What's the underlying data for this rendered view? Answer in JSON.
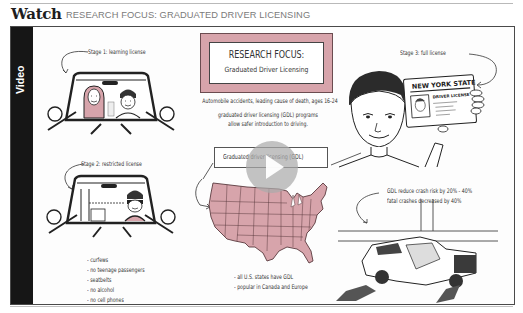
{
  "header": {
    "section_label": "Watch",
    "title": "RESEARCH FOCUS: GRADUATED DRIVER LICENSING"
  },
  "video": {
    "sidebar_label": "Video",
    "play_button": {
      "icon": "play-icon",
      "state": "paused"
    },
    "title_card": {
      "line1": "RESEARCH FOCUS:",
      "line2": "Graduated Driver Licensing",
      "accent_color": "#d7a4ab"
    },
    "intro_text": [
      "Automobile accidents, leading cause of death, ages 16-24",
      "graduated driver licensing (GDL) programs",
      "allow safer introduction to driving."
    ],
    "gdl_label": "Graduated driver licensing (GDL)",
    "stage1": {
      "label": "Stage 1: learning license",
      "illustration": "car-with-parent-and-teen"
    },
    "stage2": {
      "label": "Stage 2: restricted license",
      "illustration": "car-with-teen-driver",
      "restrictions": [
        "- curfews",
        "- no teenage passengers",
        "- seatbelts",
        "- no alcohol",
        "- no cell phones"
      ]
    },
    "stage3": {
      "label": "Stage 3: full license",
      "illustration": "teen-holding-license",
      "license_card": {
        "state": "NEW YORK STATE",
        "type": "DRIVER LICENSE"
      }
    },
    "map_notes": [
      "- all U.S. states have GDL",
      "- popular in Canada and Europe"
    ],
    "map_fill_color": "#d7a4ab",
    "crash_notes": [
      "GDL reduce crash risk by 20% - 40%",
      "fatal crashes decreased by 40%"
    ]
  }
}
